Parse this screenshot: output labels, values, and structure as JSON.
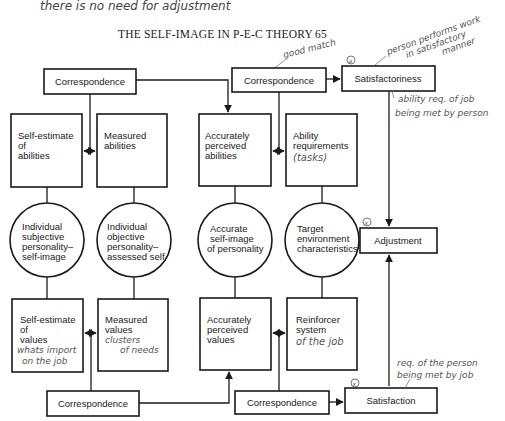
{
  "page": {
    "header_title": "THE SELF-IMAGE IN P-E-C THEORY",
    "page_number": "65"
  },
  "annotations": {
    "top_note": "there is no need for adjustment",
    "good_match": "good match",
    "person_performs_1": "person performs work",
    "person_performs_2": "in satisfactory",
    "person_performs_3": "manner",
    "ability_req_1": "ability req. of job",
    "ability_req_2": "being met by person",
    "tasks": "(tasks)",
    "whats_import_1": "whats import",
    "whats_import_2": "on the job",
    "clusters_1": "clusters",
    "clusters_2": "of needs",
    "of_the_job": "of the job",
    "req_person_1": "req. of the person",
    "req_person_2": "being met by job",
    "mark_a": "a",
    "mark_x1": "x",
    "mark_x2": "x"
  },
  "nodes": {
    "correspondence_top_left": "Correspondence",
    "correspondence_top_mid": "Correspondence",
    "satisfactoriness": "Satisfactoriness",
    "self_estimate_abilities": [
      "Self-estimate",
      "of",
      "abilities"
    ],
    "measured_abilities": [
      "Measured",
      "abilities"
    ],
    "accurately_perceived_abilities": [
      "Accurately",
      "perceived",
      "abilities"
    ],
    "ability_requirements": [
      "Ability",
      "requirements"
    ],
    "individual_subjective": [
      "Individual",
      "subjective",
      "personality–",
      "self-image"
    ],
    "individual_objective": [
      "Individual",
      "objective",
      "personality–",
      "assessed self"
    ],
    "accurate_self_image": [
      "Accurate",
      "self-image",
      "of personality"
    ],
    "target_environment": [
      "Target",
      "environment",
      "characteristics"
    ],
    "adjustment": "Adjustment",
    "self_estimate_values": [
      "Self-estimate",
      "of",
      "values"
    ],
    "measured_values": [
      "Measured",
      "values"
    ],
    "accurately_perceived_values": [
      "Accurately",
      "perceived",
      "values"
    ],
    "reinforcer_system": [
      "Reinforcer",
      "system"
    ],
    "correspondence_bottom_left": "Correspondence",
    "correspondence_bottom_mid": "Correspondence",
    "satisfaction": "Satisfaction"
  }
}
